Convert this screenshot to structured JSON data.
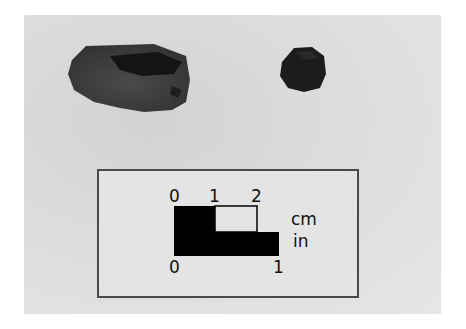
{
  "scene": {
    "description": "Photograph of two dark stone artifacts with a metric/imperial scale card",
    "background_color": "#dcdcdc"
  },
  "objects": [
    {
      "name": "large-stone-fragment",
      "color": "#3c3c3c"
    },
    {
      "name": "small-dark-pebble",
      "color": "#1a1a1a"
    }
  ],
  "scale_bar": {
    "cm_ticks": [
      "0",
      "1",
      "2"
    ],
    "in_ticks": [
      "0",
      "1"
    ],
    "cm_unit": "cm",
    "in_unit": "in"
  }
}
